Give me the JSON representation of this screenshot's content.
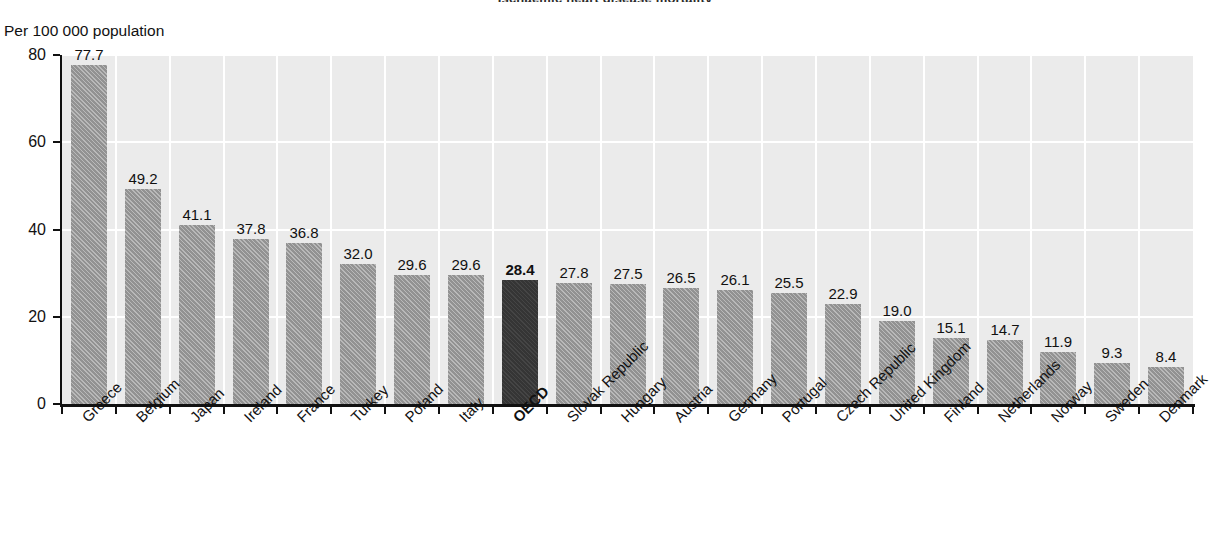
{
  "chart_data": {
    "type": "bar",
    "title": "Ischaemic heart disease mortality",
    "ylabel": "Per 100 000 population",
    "xlabel": "",
    "ylim": [
      0,
      80
    ],
    "yticks": [
      0,
      20,
      40,
      60,
      80
    ],
    "grid": true,
    "legend": "none",
    "highlight_category": "OECD",
    "categories": [
      "Greece",
      "Belgium",
      "Japan",
      "Ireland",
      "France",
      "Turkey",
      "Poland",
      "Italy",
      "OECD",
      "Slovak Republic",
      "Hungary",
      "Austria",
      "Germany",
      "Portugal",
      "Czech Republic",
      "United Kingdom",
      "Finland",
      "Netherlands",
      "Norway",
      "Sweden",
      "Denmark"
    ],
    "values": [
      77.7,
      49.2,
      41.1,
      37.8,
      36.8,
      32.0,
      29.6,
      29.6,
      28.4,
      27.8,
      27.5,
      26.5,
      26.1,
      25.5,
      22.9,
      19.0,
      15.1,
      14.7,
      11.9,
      9.3,
      8.4
    ],
    "value_labels": [
      "77.7",
      "49.2",
      "41.1",
      "37.8",
      "36.8",
      "32.0",
      "29.6",
      "29.6",
      "28.4",
      "27.8",
      "27.5",
      "26.5",
      "26.1",
      "25.5",
      "22.9",
      "19.0",
      "15.1",
      "14.7",
      "11.9",
      "9.3",
      "8.4"
    ],
    "colors": {
      "bar": "#9b9b9b",
      "bar_highlight": "#3b3b3b",
      "plot_background": "#ebebeb",
      "gridline": "#ffffff",
      "axis": "#111111",
      "text": "#111111"
    }
  }
}
